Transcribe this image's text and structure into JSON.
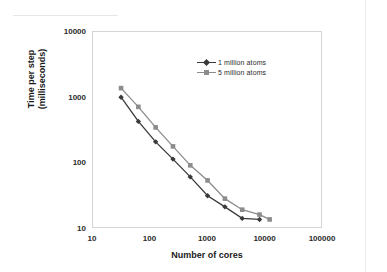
{
  "chart_data": {
    "type": "line",
    "title": "",
    "xlabel": "Number of cores",
    "ylabel": "Time per step (milliseconds)",
    "ylabel_line1": "Time per step",
    "ylabel_line2": "(milliseconds)",
    "xscale": "log",
    "yscale": "log",
    "xlim": [
      10,
      100000
    ],
    "ylim": [
      10,
      10000
    ],
    "xticks": [
      "10",
      "100",
      "1000",
      "10000",
      "100000"
    ],
    "xtick_values": [
      10,
      100,
      1000,
      10000,
      100000
    ],
    "yticks": [
      "10",
      "100",
      "1000",
      "10000"
    ],
    "ytick_values": [
      10,
      100,
      1000,
      10000
    ],
    "grid": false,
    "legend_position": "upper right",
    "series": [
      {
        "name": "1 million atoms",
        "color": "#3a3a3a",
        "marker": "diamond",
        "x": [
          32,
          64,
          128,
          256,
          512,
          1024,
          2048,
          4096,
          8192
        ],
        "values": [
          980,
          420,
          205,
          112,
          60,
          31,
          21,
          14,
          13.5
        ]
      },
      {
        "name": "5 million atoms",
        "color": "#8c8c8c",
        "marker": "square",
        "x": [
          32,
          64,
          128,
          256,
          512,
          1024,
          2048,
          4096,
          8192,
          12288
        ],
        "values": [
          1350,
          700,
          340,
          175,
          90,
          53,
          28,
          19,
          16,
          13.5
        ]
      }
    ]
  },
  "legend": {
    "items": [
      {
        "label": "1 million atoms"
      },
      {
        "label": "5 million atoms"
      }
    ]
  },
  "colors": {
    "series_1": "#3a3a3a",
    "series_2": "#8c8c8c",
    "frame": "#d5d5d5",
    "text": "#1a1a1a",
    "background": "#ffffff"
  }
}
